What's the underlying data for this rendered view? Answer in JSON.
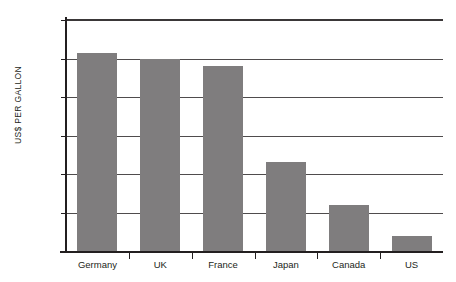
{
  "chart_data": {
    "type": "bar",
    "title": "",
    "subtitle": "",
    "xlabel": "",
    "ylabel": "US$ PER GALLON",
    "categories": [
      "Germany",
      "UK",
      "France",
      "Japan",
      "Canada",
      "US"
    ],
    "values": [
      5.15,
      5.0,
      4.8,
      2.3,
      1.2,
      0.4
    ],
    "series": [
      {
        "name": "US$ per gallon",
        "values": [
          5.15,
          5.0,
          4.8,
          2.3,
          1.2,
          0.4
        ]
      }
    ],
    "ylim": [
      0,
      6
    ],
    "ytick_values": [
      6,
      5,
      4,
      3,
      2,
      1,
      0
    ],
    "ytick_labels": [
      "6.00",
      "5.00",
      "4.00",
      "3.00",
      "2.00",
      "1.00",
      "$0"
    ],
    "grid": true,
    "grid_axis": "y",
    "legend": false,
    "legend_position": "none",
    "bar_color": "#7f7d7e",
    "axis_color": "#231f20",
    "gridline_color": "#4f4c4d",
    "background_color": "#ffffff"
  }
}
